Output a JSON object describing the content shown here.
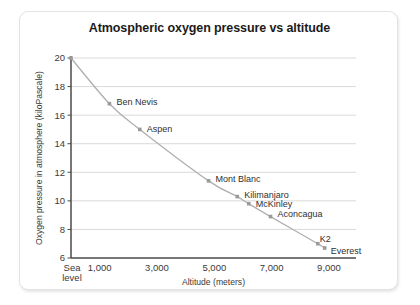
{
  "card": {
    "background": "#ffffff",
    "border_color": "#e3e3e3"
  },
  "chart_data": {
    "type": "line",
    "title": "Atmospheric oxygen pressure vs altitude",
    "xlabel": "Altitude (meters)",
    "ylabel": "Oxygen pressure in atmosphere (kiloPascale)",
    "xlim": [
      0,
      10000
    ],
    "ylim": [
      6,
      20
    ],
    "grid": true,
    "legend": "none",
    "line_color": "#b0b0b0",
    "marker_color": "#9a9a9a",
    "xticks": [
      {
        "value": 0,
        "label": "Sea level"
      },
      {
        "value": 1000,
        "label": "1,000"
      },
      {
        "value": 3000,
        "label": "3,000"
      },
      {
        "value": 5000,
        "label": "5,000"
      },
      {
        "value": 7000,
        "label": "7,000"
      },
      {
        "value": 9000,
        "label": "9,000"
      }
    ],
    "yticks": [
      {
        "value": 6,
        "label": "6"
      },
      {
        "value": 8,
        "label": "8"
      },
      {
        "value": 10,
        "label": "10"
      },
      {
        "value": 12,
        "label": "12"
      },
      {
        "value": 14,
        "label": "14"
      },
      {
        "value": 16,
        "label": "16"
      },
      {
        "value": 18,
        "label": "18"
      },
      {
        "value": 20,
        "label": "20"
      }
    ],
    "points": [
      {
        "name": "Sea level",
        "x": 0,
        "y": 20.0,
        "label": "",
        "label_dx": 0,
        "label_dy": 0,
        "label_anchor": "start"
      },
      {
        "name": "Ben Nevis",
        "x": 1340,
        "y": 16.8,
        "label": "Ben Nevis",
        "label_dx": 7,
        "label_dy": -2,
        "label_anchor": "start"
      },
      {
        "name": "Aspen",
        "x": 2400,
        "y": 15.0,
        "label": "Aspen",
        "label_dx": 7,
        "label_dy": 0,
        "label_anchor": "start"
      },
      {
        "name": "Mont Blanc",
        "x": 4800,
        "y": 11.4,
        "label": "Mont Blanc",
        "label_dx": 7,
        "label_dy": -2,
        "label_anchor": "start"
      },
      {
        "name": "Kilimanjaro",
        "x": 5800,
        "y": 10.3,
        "label": "Kilimanjaro",
        "label_dx": 7,
        "label_dy": -2,
        "label_anchor": "start"
      },
      {
        "name": "McKinley",
        "x": 6200,
        "y": 9.8,
        "label": "McKinley",
        "label_dx": 7,
        "label_dy": 0,
        "label_anchor": "start"
      },
      {
        "name": "Aconcagua",
        "x": 6960,
        "y": 8.9,
        "label": "Aconcagua",
        "label_dx": 7,
        "label_dy": -3,
        "label_anchor": "start"
      },
      {
        "name": "K2",
        "x": 8610,
        "y": 7.0,
        "label": "K2",
        "label_dx": 2,
        "label_dy": -5,
        "label_anchor": "start"
      },
      {
        "name": "Everest",
        "x": 8850,
        "y": 6.7,
        "label": "Everest",
        "label_dx": 6,
        "label_dy": 3,
        "label_anchor": "start"
      }
    ]
  }
}
